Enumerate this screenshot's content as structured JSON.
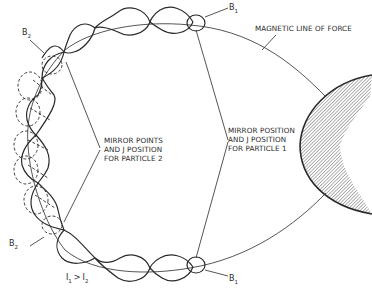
{
  "diagram": {
    "labels": {
      "field_line": "MAGNETIC LINE OF FORCE",
      "particle2_line1": "MIRROR POINTS",
      "particle2_line2": "AND J POSITION",
      "particle2_line3": "FOR PARTICLE 2",
      "particle1_line1": "MIRROR POSITION",
      "particle1_line2": "AND J POSITION",
      "particle1_line3": "FOR PARTICLE 1",
      "b1_top": "B",
      "b1_top_sub": "1",
      "b1_bottom": "B",
      "b1_bottom_sub": "1",
      "b2_top": "B",
      "b2_top_sub": "2",
      "b2_bottom": "B",
      "b2_bottom_sub": "2",
      "inequality_i1": "I",
      "inequality_i1_sub": "1",
      "inequality_op": ">",
      "inequality_i2": "I",
      "inequality_i2_sub": "2"
    },
    "colors": {
      "line": "#2a2a2a",
      "hatch": "#555555",
      "background": "#ffffff"
    }
  }
}
